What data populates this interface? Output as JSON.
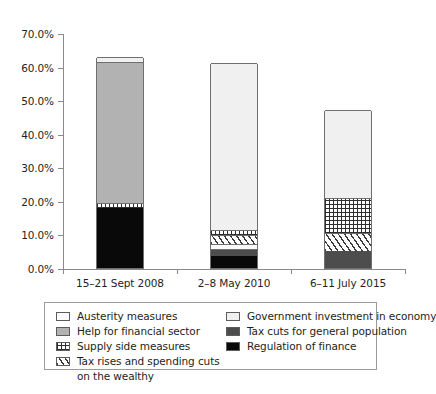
{
  "chart_data": {
    "type": "bar",
    "subtype": "stacked-bar",
    "title": "",
    "subtitle": "",
    "xlabel": "",
    "ylabel": "",
    "grid": false,
    "legend_position": "bottom",
    "ylim": [
      0,
      70
    ],
    "ytick_labels": [
      "70.0%",
      "60.0%",
      "50.0%",
      "40.0%",
      "30.0%",
      "20.0%",
      "10.0%",
      "0.0%"
    ],
    "ytick_values": [
      70,
      60,
      50,
      40,
      30,
      20,
      10,
      0
    ],
    "categories": [
      "15–21 Sept 2008",
      "2–8 May 2010",
      "6–11 July 2015"
    ],
    "series": [
      {
        "name": "Regulation of finance",
        "key": "regfin",
        "values": [
          18.0,
          3.5,
          0.0
        ]
      },
      {
        "name": "Tax cuts for general population",
        "key": "taxcuts",
        "values": [
          0.0,
          2.2,
          5.0
        ]
      },
      {
        "name": "Austerity measures",
        "key": "austerity",
        "values": [
          0.0,
          1.4,
          0.0
        ]
      },
      {
        "name": "Tax rises and spending cuts on the wealthy",
        "key": "taxrise",
        "values": [
          0.0,
          2.7,
          5.4
        ]
      },
      {
        "name": "Supply side measures",
        "key": "supply",
        "values": [
          1.5,
          1.5,
          10.6
        ]
      },
      {
        "name": "Help for financial sector",
        "key": "helpfin",
        "values": [
          42.0,
          0.0,
          0.0
        ]
      },
      {
        "name": "Government investment in economy",
        "key": "govinvest",
        "values": [
          1.5,
          49.7,
          26.0
        ]
      }
    ],
    "totals": [
      63.0,
      61.0,
      47.0
    ]
  },
  "legend": {
    "items": [
      {
        "label": "Austerity measures",
        "key": "austerity"
      },
      {
        "label": "Help for financial sector",
        "key": "helpfin"
      },
      {
        "label": "Supply side measures",
        "key": "supply"
      },
      {
        "label": "Tax rises and spending cuts",
        "key": "taxrise"
      },
      {
        "label": "Government investment in economy",
        "key": "govinvest"
      },
      {
        "label": "Tax cuts for general population",
        "key": "taxcuts"
      },
      {
        "label": "Regulation of finance",
        "key": "regfin"
      }
    ],
    "wrapped_line": "on the wealthy"
  }
}
